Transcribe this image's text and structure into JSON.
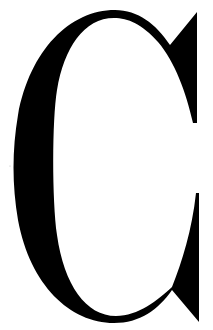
{
  "glyph": {
    "character": "C",
    "style": "serif",
    "color": "#000000",
    "background": "#ffffff"
  }
}
